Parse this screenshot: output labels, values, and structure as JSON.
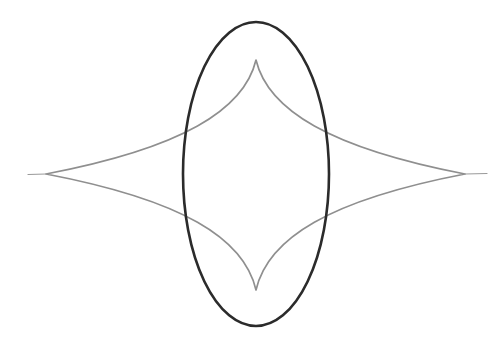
{
  "document": {
    "title": "Geometric Figure: Ellipse and Four-Cusped Astroid-like Curve",
    "background_color": "#ffffff",
    "width": 501,
    "height": 346
  },
  "figure": {
    "name": "ellipse-and-astroid-overlay",
    "caption": "",
    "center": {
      "x": 256,
      "y": 174
    },
    "shapes": [
      {
        "id": "ellipse",
        "label": "Dark vertical ellipse",
        "type": "ellipse",
        "cx": 256,
        "cy": 174,
        "rx": 73,
        "ry": 152,
        "stroke_color": "#2b2b2b",
        "stroke_width": 2.6,
        "fill": "none"
      },
      {
        "id": "astroid",
        "label": "Gray four-cusped concave curve",
        "type": "closed-curve",
        "stroke_color": "#8f8f8f",
        "stroke_width": 1.7,
        "fill": "none",
        "cusps": [
          {
            "name": "top-cusp",
            "x": 256,
            "y": 60
          },
          {
            "name": "right-cusp",
            "x": 465,
            "y": 174
          },
          {
            "name": "bottom-cusp",
            "x": 256,
            "y": 290
          },
          {
            "name": "left-cusp",
            "x": 46,
            "y": 174
          }
        ],
        "path": "M 256 60 C 268 110 330 148 465 174 C 330 200 268 238 256 290 C 244 238 182 200 46 174 C 182 148 244 110 256 60 Z"
      },
      {
        "id": "left-tail",
        "label": "Thin tail extending left from the left cusp",
        "type": "line",
        "x1": 46,
        "y1": 174,
        "x2": 28,
        "y2": 174.5,
        "stroke_color": "#9a9a9a",
        "stroke_width": 1.2
      },
      {
        "id": "right-tail",
        "label": "Thin tail extending right from the right cusp",
        "type": "line",
        "x1": 465,
        "y1": 174,
        "x2": 487,
        "y2": 173.5,
        "stroke_color": "#9a9a9a",
        "stroke_width": 1.2
      }
    ],
    "intersections": [
      {
        "name": "upper-left-intersection",
        "x": 186,
        "y": 133
      },
      {
        "name": "upper-right-intersection",
        "x": 326,
        "y": 133
      },
      {
        "name": "lower-left-intersection",
        "x": 186,
        "y": 216
      },
      {
        "name": "lower-right-intersection",
        "x": 326,
        "y": 216
      }
    ]
  }
}
